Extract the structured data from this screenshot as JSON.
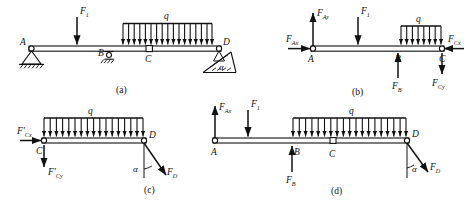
{
  "figure": {
    "title_cut_text": "",
    "panels": [
      {
        "id": "a",
        "label": "(a)",
        "description": "compound beam with pin support A, roller support B, internal hinge C, inclined roller support D",
        "points": [
          "A",
          "B",
          "C",
          "D"
        ],
        "loads": {
          "concentrated": "F",
          "concentrated_sub": "1",
          "distributed": "q"
        },
        "angle": "α"
      },
      {
        "id": "b",
        "label": "(b)",
        "description": "free body diagram of segment AC",
        "points": [
          "A",
          "B",
          "C"
        ],
        "forces": [
          {
            "name": "F",
            "sub": "Ax",
            "dir": "right"
          },
          {
            "name": "F",
            "sub": "Ay",
            "dir": "up"
          },
          {
            "name": "F",
            "sub": "1",
            "dir": "down"
          },
          {
            "name": "F",
            "sub": "B",
            "dir": "up"
          },
          {
            "name": "F",
            "sub": "Cx",
            "dir": "left"
          },
          {
            "name": "F",
            "sub": "Cy",
            "dir": "down"
          }
        ],
        "distributed": "q"
      },
      {
        "id": "c",
        "label": "(c)",
        "description": "free body diagram of segment CD",
        "points": [
          "C",
          "D"
        ],
        "forces": [
          {
            "name": "F'",
            "sub": "Cx",
            "dir": "right"
          },
          {
            "name": "F'",
            "sub": "Cy",
            "dir": "down"
          },
          {
            "name": "F",
            "sub": "D",
            "dir": "inclined"
          }
        ],
        "distributed": "q",
        "angle": "α"
      },
      {
        "id": "d",
        "label": "(d)",
        "description": "free body diagram of the whole beam AD",
        "points": [
          "A",
          "B",
          "C",
          "D"
        ],
        "forces": [
          {
            "name": "F",
            "sub": "Ax",
            "dir": "up"
          },
          {
            "name": "F",
            "sub": "1",
            "dir": "down"
          },
          {
            "name": "F",
            "sub": "B",
            "dir": "up"
          },
          {
            "name": "F",
            "sub": "D",
            "dir": "inclined"
          }
        ],
        "distributed": "q",
        "angle": "α"
      }
    ],
    "symbols": {
      "force_F": "F",
      "load_q": "q",
      "alpha": "α",
      "prime": "'"
    },
    "colors": {
      "ink": "#111111",
      "paper": "#ffffff"
    }
  }
}
